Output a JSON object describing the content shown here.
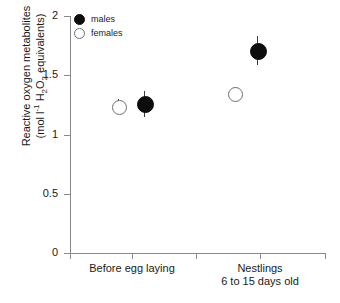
{
  "chart_data": {
    "type": "scatter",
    "title": "",
    "xlabel": "",
    "ylabel": "Reactive oxygen metabolites (mol l-1 H2O2 equivalents)",
    "ylabel_line1": "Reactive oxygen metabolites",
    "ylabel_line2_pre": "(mol l",
    "ylabel_line2_sup": "-1",
    "ylabel_line2_mid": " H",
    "ylabel_line2_sub1": "2",
    "ylabel_line2_mid2": "O",
    "ylabel_line2_sub2": "2",
    "ylabel_line2_post": " equivalents)",
    "categories": [
      "Before egg laying",
      "Nestlings 6 to 15 days old"
    ],
    "category_labels": [
      {
        "line1": "Before egg laying",
        "line2": ""
      },
      {
        "line1": "Nestlings",
        "line2": "6 to 15 days old"
      }
    ],
    "ylim": [
      0,
      2
    ],
    "yticks": [
      0,
      0.5,
      1,
      1.5,
      2
    ],
    "ytick_labels": [
      "0",
      "0.5",
      "1",
      "1.5",
      "2"
    ],
    "grid": false,
    "legend_position": "top-left",
    "series": [
      {
        "name": "males",
        "marker": "filled-circle",
        "color": "#0d0d0d",
        "values": [
          1.26,
          1.71
        ],
        "err_low": [
          0.11,
          0.12
        ],
        "err_high": [
          0.11,
          0.12
        ]
      },
      {
        "name": "females",
        "marker": "open-circle",
        "color": "#6e6e6e",
        "values": [
          1.24,
          1.35
        ],
        "err_low": [
          0.06,
          0.05
        ],
        "err_high": [
          0.06,
          0.05
        ]
      }
    ],
    "points": [
      {
        "series": "females",
        "category": "Before egg laying",
        "value": 1.24,
        "err_low": 0.06,
        "err_high": 0.06,
        "x_px": 118,
        "y_px": 106
      },
      {
        "series": "males",
        "category": "Before egg laying",
        "value": 1.26,
        "err_low": 0.11,
        "err_high": 0.11,
        "x_px": 144,
        "y_px": 104
      },
      {
        "series": "females",
        "category": "Nestlings 6 to 15 days old",
        "value": 1.35,
        "err_low": 0.05,
        "err_high": 0.05,
        "x_px": 234,
        "y_px": 93
      },
      {
        "series": "males",
        "category": "Nestlings 6 to 15 days old",
        "value": 1.71,
        "err_low": 0.12,
        "err_high": 0.12,
        "x_px": 257,
        "y_px": 50
      }
    ]
  },
  "legend": {
    "items": [
      {
        "label": "males",
        "marker": "filled-circle"
      },
      {
        "label": "females",
        "marker": "open-circle"
      }
    ]
  },
  "axis": {
    "y_tick_labels": [
      "2",
      "1.5",
      "1",
      "0.5",
      "0"
    ],
    "x_tick_count": 5
  },
  "colors": {
    "axis": "#8a8a8a",
    "males": "#0d0d0d",
    "females": "#6e6e6e",
    "text": "#1a1a1a",
    "background": "#ffffff"
  }
}
